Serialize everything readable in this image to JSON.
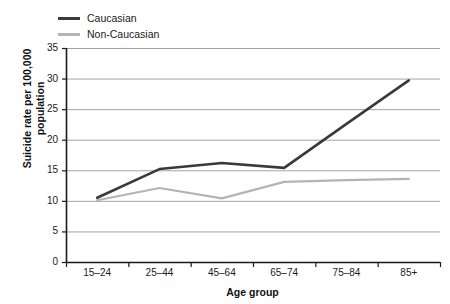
{
  "chart_data": {
    "type": "line",
    "title": "",
    "xlabel": "Age group",
    "ylabel": "Suicide rate per 100,000 population",
    "ylabel_line1": "Suicide rate per 100,000",
    "ylabel_line2": "population",
    "categories": [
      "15–24",
      "25–44",
      "45–64",
      "65–74",
      "75–84",
      "85+"
    ],
    "ylim": [
      0,
      35
    ],
    "ytick_values": [
      0,
      5,
      10,
      15,
      20,
      25,
      30,
      35
    ],
    "ytick_labels": [
      "0",
      "5",
      "10",
      "15",
      "20",
      "25",
      "30",
      "35"
    ],
    "grid": true,
    "grid_axis": "y",
    "legend_position": "top-left",
    "series": [
      {
        "name": "Caucasian",
        "color": "#3a3a3a",
        "values": [
          10.5,
          15.2,
          16.2,
          15.4,
          22.6,
          29.7
        ]
      },
      {
        "name": "Non-Caucasian",
        "color": "#b4b4b4",
        "values": [
          10.1,
          12.1,
          10.4,
          13.1,
          13.4,
          13.6
        ]
      }
    ]
  },
  "style": {
    "axis_color": "#1a1a1a",
    "grid_color": "#9a9a9a",
    "background": "#ffffff"
  }
}
